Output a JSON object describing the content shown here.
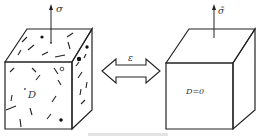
{
  "diagram": {
    "damaged_block": {
      "stress_label": "σ",
      "damage_label": "D"
    },
    "arrow": {
      "label": "ε"
    },
    "undamaged_block": {
      "stress_label": "σ̃",
      "damage_label": "D=0"
    },
    "caption": ""
  }
}
